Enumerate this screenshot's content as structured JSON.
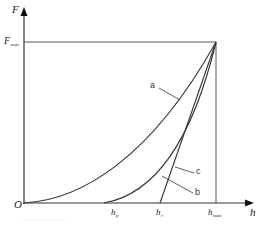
{
  "diagram": {
    "type": "load-displacement curve (indentation)",
    "axes": {
      "y_label": "F",
      "x_label": "h",
      "origin_label": "O"
    },
    "y_ticks": [
      {
        "label_main": "F",
        "label_sub": "max"
      }
    ],
    "x_ticks": [
      {
        "id": "hp",
        "label_main": "h",
        "label_sub": "p"
      },
      {
        "id": "hr",
        "label_main": "h",
        "label_sub": "r"
      },
      {
        "id": "hmax",
        "label_main": "h",
        "label_sub": "max"
      }
    ],
    "curves": [
      {
        "id": "a",
        "label": "a",
        "description": "loading curve"
      },
      {
        "id": "b",
        "label": "b",
        "description": "unloading curve"
      },
      {
        "id": "c",
        "label": "c",
        "description": "tangent line at unloading start"
      }
    ],
    "colors": {
      "line": "#333333",
      "background": "#ffffff"
    },
    "caption": "……………………"
  }
}
